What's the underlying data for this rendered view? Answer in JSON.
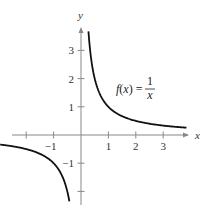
{
  "chart_data": {
    "type": "line",
    "title": "",
    "function_label": {
      "lhs": "f(x) =",
      "numerator": "1",
      "denominator": "x"
    },
    "xlabel": "x",
    "ylabel": "y",
    "xlim": [
      -2.9,
      3.9
    ],
    "ylim": [
      -2.6,
      3.9
    ],
    "x_ticks": [
      -2,
      -1,
      1,
      2,
      3
    ],
    "x_tick_labels": [
      "",
      "-1",
      "1",
      "2",
      "3"
    ],
    "y_ticks": [
      -2,
      -1,
      1,
      2,
      3
    ],
    "y_tick_labels": [
      "",
      "-1",
      "1",
      "2",
      "3"
    ],
    "grid": false,
    "series": [
      {
        "name": "f(x) = 1/x (x>0)",
        "x": [
          0.27,
          0.3,
          0.4,
          0.5,
          0.75,
          1,
          1.5,
          2,
          2.5,
          3,
          3.5,
          3.8
        ],
        "y": [
          3.7,
          3.33,
          2.5,
          2,
          1.33,
          1,
          0.67,
          0.5,
          0.4,
          0.33,
          0.29,
          0.26
        ]
      },
      {
        "name": "f(x) = 1/x (x<0)",
        "x": [
          -2.5,
          -2,
          -1.5,
          -1,
          -0.75,
          -0.6,
          -0.5,
          -0.42
        ],
        "y": [
          -0.4,
          -0.5,
          -0.67,
          -1,
          -1.33,
          -1.67,
          -2,
          -2.4
        ]
      }
    ],
    "color": "#111111"
  },
  "labels": {
    "y_axis": "y",
    "x_axis": "x"
  }
}
